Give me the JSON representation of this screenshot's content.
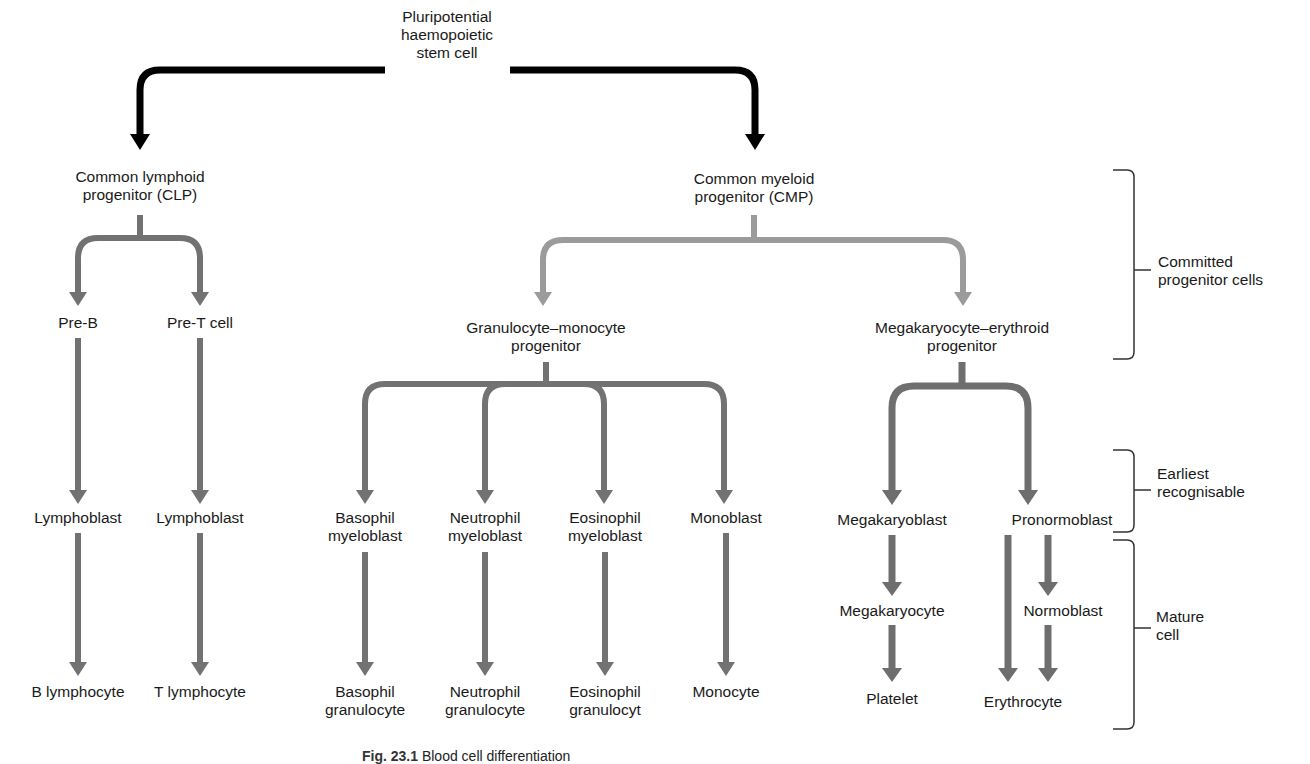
{
  "colors": {
    "root_arrow": "#000000",
    "cmp_branch_arrow": "#9b9b9b",
    "lineage_arrow": "#727272",
    "text": "#1a1a1a",
    "bracket": "#333333"
  },
  "nodes": {
    "root": {
      "line1": "Pluripotential",
      "line2": "haemopoietic",
      "line3": "stem cell"
    },
    "clp": {
      "line1": "Common lymphoid",
      "line2": "progenitor (CLP)"
    },
    "cmp": {
      "line1": "Common myeloid",
      "line2": "progenitor (CMP)"
    },
    "pre_b": {
      "line1": "Pre-B"
    },
    "pre_t": {
      "line1": "Pre-T cell"
    },
    "gmp": {
      "line1": "Granulocyte–monocyte",
      "line2": "progenitor"
    },
    "mep": {
      "line1": "Megakaryocyte–erythroid",
      "line2": "progenitor"
    },
    "lymphoblast_b": {
      "line1": "Lymphoblast"
    },
    "lymphoblast_t": {
      "line1": "Lymphoblast"
    },
    "basophil_myeloblast": {
      "line1": "Basophil",
      "line2": "myeloblast"
    },
    "neutrophil_myeloblast": {
      "line1": "Neutrophil",
      "line2": "myeloblast"
    },
    "eosinophil_myeloblast": {
      "line1": "Eosinophil",
      "line2": "myeloblast"
    },
    "monoblast": {
      "line1": "Monoblast"
    },
    "megakaryoblast": {
      "line1": "Megakaryoblast"
    },
    "pronormoblast": {
      "line1": "Pronormoblast"
    },
    "megakaryocyte": {
      "line1": "Megakaryocyte"
    },
    "normoblast": {
      "line1": "Normoblast"
    },
    "b_lymphocyte": {
      "line1": "B lymphocyte"
    },
    "t_lymphocyte": {
      "line1": "T lymphocyte"
    },
    "basophil_granulocyte": {
      "line1": "Basophil",
      "line2": "granulocyte"
    },
    "neutrophil_granulocyte": {
      "line1": "Neutrophil",
      "line2": "granulocyte"
    },
    "eosinophil_granulocyte": {
      "line1": "Eosinophil",
      "line2": "granulocyt"
    },
    "monocyte": {
      "line1": "Monocyte"
    },
    "platelet": {
      "line1": "Platelet"
    },
    "erythrocyte": {
      "line1": "Erythrocyte"
    }
  },
  "stages": [
    {
      "line1": "Committed",
      "line2": "progenitor cells"
    },
    {
      "line1": "Earliest",
      "line2": "recognisable"
    },
    {
      "line1": "Mature",
      "line2": "cell"
    }
  ],
  "caption": {
    "label": "Fig. 23.1",
    "text": "Blood cell differentiation"
  }
}
